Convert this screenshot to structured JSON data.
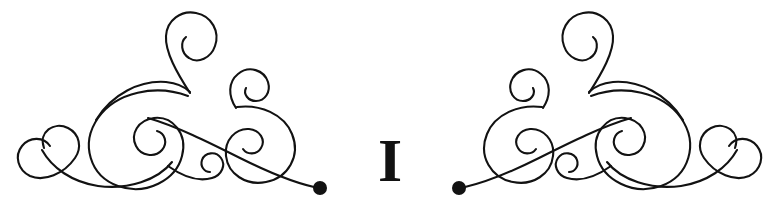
{
  "page": {
    "width": 779,
    "height": 210,
    "background_color": "#ffffff",
    "ink_color": "#121212"
  },
  "ornament": {
    "kind": "typographic-fleuron",
    "description": "Two mirror-image calligraphic swirl flourishes flanking a serif capital letter",
    "stroke_width": 2.1,
    "left_flourish_label": "left-flourish",
    "right_flourish_label": "right-flourish",
    "terminal_dot_color": "#121212",
    "left_terminal_dot": {
      "cx": 320,
      "cy": 188,
      "r": 7
    },
    "right_terminal_dot": {
      "cx": 459,
      "cy": 188,
      "r": 7
    }
  },
  "center": {
    "letter": "I",
    "letter_name": "capital-i",
    "font_style": "serif",
    "font_weight": "bold",
    "color": "#121212"
  }
}
